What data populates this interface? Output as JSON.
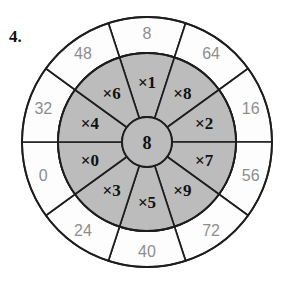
{
  "worksheet": {
    "item_number": "4.",
    "center_value": "8",
    "colors": {
      "inner_ring_fill": "#bcbcbc",
      "outer_ring_fill": "#fdfdfd",
      "stroke": "#1d1d1d",
      "outer_label_color": "#8e8e8e",
      "inner_label_color": "#111111"
    },
    "geometry": {
      "center_x": 147,
      "center_y": 142,
      "outer_radius": 125,
      "middle_radius": 89,
      "hub_radius": 25,
      "sector_count": 10,
      "sector_span_degrees": 36,
      "first_sector_center_degrees": 18
    },
    "sectors": [
      {
        "multiplier": "×1",
        "product": "8",
        "angle": 0
      },
      {
        "multiplier": "×8",
        "product": "64",
        "angle": 36
      },
      {
        "multiplier": "×2",
        "product": "16",
        "angle": 72
      },
      {
        "multiplier": "×7",
        "product": "56",
        "angle": 108
      },
      {
        "multiplier": "×9",
        "product": "72",
        "angle": 144
      },
      {
        "multiplier": "×5",
        "product": "40",
        "angle": 180
      },
      {
        "multiplier": "×3",
        "product": "24",
        "angle": 216
      },
      {
        "multiplier": "×0",
        "product": "0",
        "angle": 252
      },
      {
        "multiplier": "×4",
        "product": "32",
        "angle": 288
      },
      {
        "multiplier": "×6",
        "product": "48",
        "angle": 324
      }
    ]
  }
}
